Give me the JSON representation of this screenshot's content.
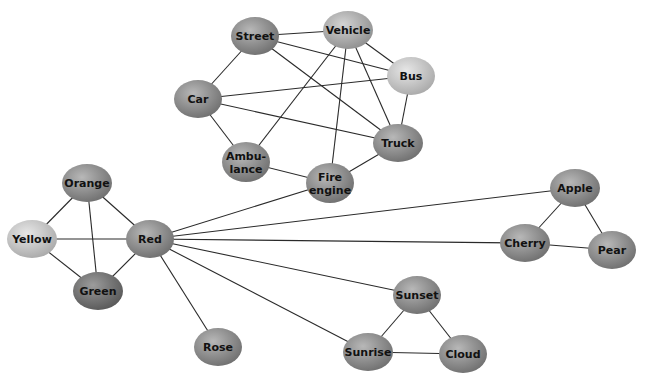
{
  "diagram": {
    "type": "network-graph",
    "nodes": [
      {
        "id": "street",
        "label": [
          "Street"
        ],
        "x": 255,
        "y": 36,
        "rx": 24,
        "ry": 19,
        "shade": "mid"
      },
      {
        "id": "vehicle",
        "label": [
          "Vehicle"
        ],
        "x": 348,
        "y": 30,
        "rx": 25,
        "ry": 19,
        "shade": "light-mid"
      },
      {
        "id": "bus",
        "label": [
          "Bus"
        ],
        "x": 411,
        "y": 76,
        "rx": 24,
        "ry": 19,
        "shade": "light"
      },
      {
        "id": "car",
        "label": [
          "Car"
        ],
        "x": 198,
        "y": 99,
        "rx": 24,
        "ry": 19,
        "shade": "mid"
      },
      {
        "id": "truck",
        "label": [
          "Truck"
        ],
        "x": 398,
        "y": 143,
        "rx": 25,
        "ry": 19,
        "shade": "mid"
      },
      {
        "id": "ambulance",
        "label": [
          "Ambu-",
          "lance"
        ],
        "x": 246,
        "y": 162,
        "rx": 24,
        "ry": 20,
        "shade": "mid"
      },
      {
        "id": "fire-engine",
        "label": [
          "Fire",
          "engine"
        ],
        "x": 330,
        "y": 183,
        "rx": 24,
        "ry": 20,
        "shade": "mid"
      },
      {
        "id": "orange",
        "label": [
          "Orange"
        ],
        "x": 87,
        "y": 183,
        "rx": 25,
        "ry": 19,
        "shade": "mid"
      },
      {
        "id": "yellow",
        "label": [
          "Yellow"
        ],
        "x": 32,
        "y": 239,
        "rx": 25,
        "ry": 19,
        "shade": "light"
      },
      {
        "id": "red",
        "label": [
          "Red"
        ],
        "x": 150,
        "y": 239,
        "rx": 24,
        "ry": 19,
        "shade": "mid"
      },
      {
        "id": "green",
        "label": [
          "Green"
        ],
        "x": 98,
        "y": 291,
        "rx": 25,
        "ry": 19,
        "shade": "dark"
      },
      {
        "id": "rose",
        "label": [
          "Rose"
        ],
        "x": 218,
        "y": 347,
        "rx": 24,
        "ry": 19,
        "shade": "mid"
      },
      {
        "id": "apple",
        "label": [
          "Apple"
        ],
        "x": 575,
        "y": 188,
        "rx": 25,
        "ry": 19,
        "shade": "mid"
      },
      {
        "id": "cherry",
        "label": [
          "Cherry"
        ],
        "x": 525,
        "y": 243,
        "rx": 25,
        "ry": 19,
        "shade": "mid"
      },
      {
        "id": "pear",
        "label": [
          "Pear"
        ],
        "x": 612,
        "y": 250,
        "rx": 24,
        "ry": 19,
        "shade": "mid"
      },
      {
        "id": "sunset",
        "label": [
          "Sunset"
        ],
        "x": 417,
        "y": 295,
        "rx": 24,
        "ry": 19,
        "shade": "mid"
      },
      {
        "id": "sunrise",
        "label": [
          "Sunrise"
        ],
        "x": 368,
        "y": 352,
        "rx": 25,
        "ry": 19,
        "shade": "mid"
      },
      {
        "id": "cloud",
        "label": [
          "Cloud"
        ],
        "x": 463,
        "y": 354,
        "rx": 24,
        "ry": 19,
        "shade": "mid"
      }
    ],
    "edges": [
      [
        "street",
        "vehicle"
      ],
      [
        "street",
        "bus"
      ],
      [
        "street",
        "truck"
      ],
      [
        "street",
        "car"
      ],
      [
        "vehicle",
        "bus"
      ],
      [
        "vehicle",
        "truck"
      ],
      [
        "vehicle",
        "fire-engine"
      ],
      [
        "vehicle",
        "ambulance"
      ],
      [
        "bus",
        "truck"
      ],
      [
        "car",
        "bus"
      ],
      [
        "car",
        "truck"
      ],
      [
        "car",
        "ambulance"
      ],
      [
        "ambulance",
        "fire-engine"
      ],
      [
        "fire-engine",
        "truck"
      ],
      [
        "red",
        "fire-engine"
      ],
      [
        "red",
        "apple"
      ],
      [
        "red",
        "cherry"
      ],
      [
        "red",
        "sunset"
      ],
      [
        "red",
        "sunrise"
      ],
      [
        "red",
        "rose"
      ],
      [
        "red",
        "orange"
      ],
      [
        "red",
        "yellow"
      ],
      [
        "red",
        "green"
      ],
      [
        "orange",
        "yellow"
      ],
      [
        "orange",
        "green"
      ],
      [
        "yellow",
        "green"
      ],
      [
        "apple",
        "cherry"
      ],
      [
        "apple",
        "pear"
      ],
      [
        "cherry",
        "pear"
      ],
      [
        "sunset",
        "sunrise"
      ],
      [
        "sunset",
        "cloud"
      ],
      [
        "sunrise",
        "cloud"
      ]
    ],
    "colors": {
      "edge": "#2a2a2a",
      "text": "#111111",
      "background": "#ffffff",
      "shade_light": [
        "#e6e6e6",
        "#c8c8c8",
        "#a8a8a8"
      ],
      "shade_light_mid": [
        "#d4d4d4",
        "#b0b0b0",
        "#8e8e8e"
      ],
      "shade_mid": [
        "#b8b8b8",
        "#929292",
        "#6e6e6e"
      ],
      "shade_dark": [
        "#9c9c9c",
        "#787878",
        "#575757"
      ]
    }
  }
}
